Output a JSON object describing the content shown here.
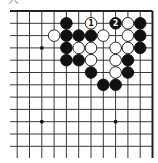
{
  "diagram": {
    "corner_glyph": "大",
    "board": {
      "visible_columns": 12,
      "visible_rows": 12,
      "edges": [
        "top",
        "right"
      ],
      "star_points": [
        {
          "col": 2,
          "row": 3
        },
        {
          "col": 2,
          "row": 9
        },
        {
          "col": 8,
          "row": 9
        }
      ],
      "stones": [
        {
          "color": "black",
          "col": 4,
          "row": 1
        },
        {
          "color": "white",
          "col": 6,
          "row": 1,
          "label": "1"
        },
        {
          "color": "black",
          "col": 8,
          "row": 1,
          "label": "2"
        },
        {
          "color": "white",
          "col": 9,
          "row": 1
        },
        {
          "color": "black",
          "col": 10,
          "row": 1
        },
        {
          "color": "white",
          "col": 3,
          "row": 2
        },
        {
          "color": "black",
          "col": 4,
          "row": 2
        },
        {
          "color": "black",
          "col": 5,
          "row": 2
        },
        {
          "color": "black",
          "col": 6,
          "row": 2
        },
        {
          "color": "white",
          "col": 7,
          "row": 2
        },
        {
          "color": "white",
          "col": 9,
          "row": 2
        },
        {
          "color": "black",
          "col": 10,
          "row": 2
        },
        {
          "color": "black",
          "col": 4,
          "row": 3
        },
        {
          "color": "white",
          "col": 5,
          "row": 3
        },
        {
          "color": "white",
          "col": 6,
          "row": 3
        },
        {
          "color": "white",
          "col": 8,
          "row": 3
        },
        {
          "color": "white",
          "col": 9,
          "row": 3
        },
        {
          "color": "black",
          "col": 10,
          "row": 3
        },
        {
          "color": "black",
          "col": 4,
          "row": 4
        },
        {
          "color": "black",
          "col": 5,
          "row": 4
        },
        {
          "color": "white",
          "col": 6,
          "row": 4
        },
        {
          "color": "white",
          "col": 8,
          "row": 4
        },
        {
          "color": "black",
          "col": 9,
          "row": 4
        },
        {
          "color": "black",
          "col": 6,
          "row": 5
        },
        {
          "color": "white",
          "col": 8,
          "row": 5
        },
        {
          "color": "black",
          "col": 9,
          "row": 5
        },
        {
          "color": "black",
          "col": 7,
          "row": 6
        },
        {
          "color": "black",
          "col": 8,
          "row": 6
        }
      ]
    }
  }
}
